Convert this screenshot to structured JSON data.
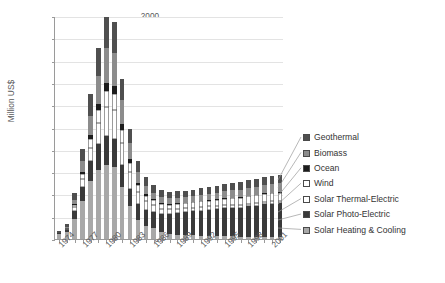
{
  "chart_data": {
    "type": "bar",
    "subtype": "stacked-bar",
    "title": "",
    "xlabel": "",
    "ylabel": "Million US$",
    "ylim": [
      0,
      2000
    ],
    "ytick_step": 200,
    "yticks": [
      2000,
      1800,
      1600,
      1400,
      1200,
      1000,
      800,
      600,
      400,
      200,
      0
    ],
    "grid": true,
    "grid_axis": "y",
    "legend_position": "right",
    "x": [
      1974,
      1975,
      1976,
      1977,
      1978,
      1979,
      1980,
      1981,
      1982,
      1983,
      1984,
      1985,
      1986,
      1987,
      1988,
      1989,
      1990,
      1991,
      1992,
      1993,
      1994,
      1995,
      1996,
      1997,
      1998,
      1999,
      2000,
      2001,
      2002
    ],
    "categories": [
      "1974",
      "1975",
      "1976",
      "1977",
      "1978",
      "1979",
      "1980",
      "1981",
      "1982",
      "1983",
      "1984",
      "1985",
      "1986",
      "1987",
      "1988",
      "1989",
      "1990",
      "1991",
      "1992",
      "1993",
      "1994",
      "1995",
      "1996",
      "1997",
      "1998",
      "1999",
      "2000",
      "2001",
      "2002"
    ],
    "xtick_labels": [
      "1974",
      "1977",
      "1980",
      "1983",
      "1986",
      "1989",
      "1992",
      "1995",
      "1998",
      "2001"
    ],
    "xtick_interval": 3,
    "stack_order_bottom_to_top": [
      "Solar Heating & Cooling",
      "Solar Photo-Electric",
      "Solar Thermal-Electric",
      "Wind",
      "Ocean",
      "Biomass",
      "Geothermal"
    ],
    "series": [
      {
        "name": "Solar Heating & Cooling",
        "color": "#a8a8a8",
        "values": [
          48,
          62,
          180,
          340,
          520,
          620,
          660,
          650,
          470,
          300,
          175,
          120,
          95,
          60,
          45,
          40,
          35,
          32,
          30,
          28,
          26,
          25,
          24,
          22,
          22,
          20,
          20,
          20,
          20
        ]
      },
      {
        "name": "Solar Photo-Electric",
        "color": "#3a3a3a",
        "values": [
          5,
          20,
          70,
          130,
          180,
          230,
          260,
          250,
          195,
          150,
          140,
          140,
          150,
          165,
          180,
          195,
          205,
          215,
          225,
          235,
          240,
          250,
          255,
          260,
          270,
          280,
          290,
          295,
          300
        ]
      },
      {
        "name": "Solar Thermal-Electric",
        "color": "#ffffff",
        "values": [
          2,
          8,
          35,
          70,
          120,
          190,
          265,
          260,
          200,
          150,
          110,
          80,
          60,
          48,
          42,
          38,
          35,
          33,
          32,
          30,
          30,
          28,
          28,
          27,
          26,
          26,
          25,
          25,
          25
        ]
      },
      {
        "name": "Wind",
        "color": "#ffffff",
        "values": [
          1,
          5,
          20,
          45,
          80,
          120,
          145,
          140,
          115,
          85,
          62,
          50,
          42,
          40,
          40,
          42,
          45,
          48,
          50,
          52,
          55,
          58,
          60,
          62,
          65,
          68,
          70,
          72,
          72
        ]
      },
      {
        "name": "Ocean",
        "color": "#1c1c1c",
        "values": [
          0,
          2,
          8,
          20,
          35,
          55,
          70,
          68,
          50,
          32,
          20,
          14,
          10,
          8,
          7,
          6,
          6,
          5,
          5,
          5,
          5,
          4,
          4,
          4,
          4,
          4,
          4,
          4,
          4
        ]
      },
      {
        "name": "Biomass",
        "color": "#8c8c8c",
        "values": [
          2,
          10,
          40,
          95,
          170,
          245,
          310,
          300,
          215,
          140,
          95,
          72,
          60,
          55,
          52,
          50,
          50,
          52,
          55,
          58,
          60,
          62,
          65,
          68,
          70,
          72,
          75,
          78,
          80
        ]
      },
      {
        "name": "Geothermal",
        "color": "#4f4f4f",
        "values": [
          10,
          28,
          60,
          110,
          195,
          250,
          280,
          277,
          190,
          130,
          95,
          78,
          68,
          62,
          58,
          56,
          56,
          57,
          58,
          60,
          62,
          63,
          65,
          67,
          70,
          72,
          74,
          76,
          78
        ]
      }
    ],
    "totals": [
      68,
      135,
      413,
      810,
      1300,
      1710,
      1990,
      1945,
      1435,
      987,
      697,
      554,
      485,
      438,
      424,
      427,
      432,
      442,
      455,
      468,
      478,
      490,
      501,
      510,
      527,
      542,
      558,
      570,
      579
    ]
  },
  "legend": {
    "items": [
      {
        "label": "Geothermal",
        "color": "#4f4f4f"
      },
      {
        "label": "Biomass",
        "color": "#8c8c8c"
      },
      {
        "label": "Ocean",
        "color": "#1c1c1c"
      },
      {
        "label": "Wind",
        "color": "#ffffff"
      },
      {
        "label": "Solar Thermal-Electric",
        "color": "#ffffff"
      },
      {
        "label": "Solar Photo-Electric",
        "color": "#3a3a3a"
      },
      {
        "label": "Solar Heating & Cooling",
        "color": "#a8a8a8"
      }
    ]
  }
}
